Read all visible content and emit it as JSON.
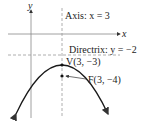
{
  "axes": {
    "x_label": "x",
    "y_label": "y"
  },
  "annotations": {
    "axis_of_symmetry": "Axis: x = 3",
    "directrix": "Directrix: y = −2",
    "vertex": "V(3, −3)",
    "focus": "F(3, −4)"
  },
  "colors": {
    "curve": "#1a1a1a",
    "axes": "#888888",
    "dashed": "#999999",
    "text": "#222222"
  }
}
